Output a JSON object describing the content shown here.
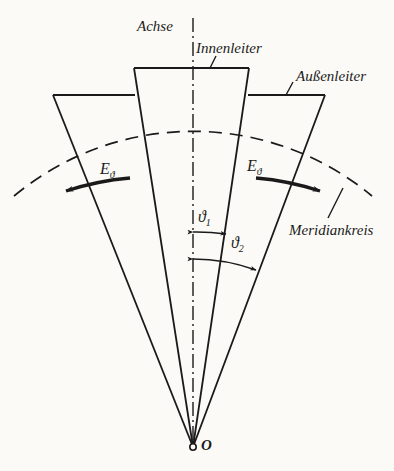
{
  "figure": {
    "kind": "technical-line-diagram",
    "background_color": "#fbfaf7",
    "ink_color": "#1a1a1a"
  },
  "labels": {
    "axis": "Achse",
    "inner_conductor": "Innenleiter",
    "outer_conductor": "Außenleiter",
    "meridian_circle": "Meridiankreis",
    "field_left": "E",
    "field_left_sub": "ϑ",
    "field_right": "E",
    "field_right_sub": "ϑ",
    "angle_1": "ϑ",
    "angle_1_sub": "1",
    "angle_2": "ϑ",
    "angle_2_sub": "2",
    "origin": "O"
  },
  "geometry": {
    "apex": {
      "x": 193,
      "y": 447
    },
    "axis_line": {
      "x": 193,
      "y_top": 18,
      "y_bottom": 447,
      "style": "dash-dot"
    },
    "inner_cone": {
      "top_left": {
        "x": 134,
        "y": 68
      },
      "top_right": {
        "x": 249,
        "y": 68
      },
      "half_angle_deg": 9.0
    },
    "outer_cone": {
      "top_left": {
        "x": 53,
        "y": 95
      },
      "top_right": {
        "x": 325,
        "y": 95
      },
      "half_angle_deg": 19.5
    },
    "meridian_arc": {
      "center_x": 193,
      "center_y": 447,
      "radius": 280,
      "style": "dashed"
    },
    "field_arcs": {
      "radius": 280,
      "style": "thick-solid-with-arrowhead"
    },
    "angle_arc_1": {
      "radius": 215,
      "from_deg": 0,
      "to_deg": 9
    },
    "angle_arc_2": {
      "radius": 188,
      "from_deg": 0,
      "to_deg": 19.5
    }
  },
  "label_positions": {
    "axis": {
      "x": 137,
      "y": 18
    },
    "inner_conductor": {
      "x": 196,
      "y": 40
    },
    "outer_conductor": {
      "x": 296,
      "y": 68
    },
    "meridian_circle": {
      "x": 289,
      "y": 222
    },
    "field_left": {
      "x": 100,
      "y": 160
    },
    "field_right": {
      "x": 247,
      "y": 157
    },
    "angle_1": {
      "x": 198,
      "y": 208
    },
    "angle_2": {
      "x": 231,
      "y": 234
    },
    "origin": {
      "x": 201,
      "y": 437
    }
  }
}
